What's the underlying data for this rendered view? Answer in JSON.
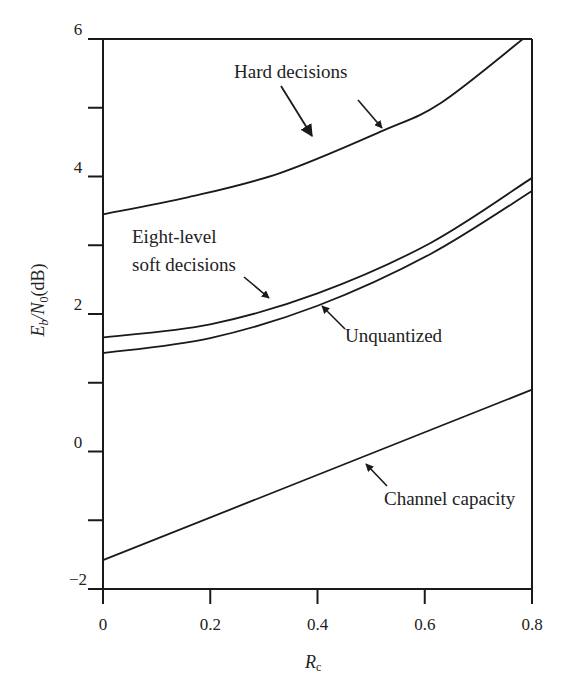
{
  "chart_data": {
    "type": "line",
    "title": "",
    "xlabel": "R_c",
    "ylabel": "E_b/N_0 (dB)",
    "xlim": [
      0,
      0.8
    ],
    "ylim": [
      -2,
      6
    ],
    "grid": false,
    "legend": "none (curves labeled by annotations with arrows)",
    "x_ticks": [
      0,
      0.2,
      0.4,
      0.6,
      0.8
    ],
    "x_tick_labels": [
      "0",
      "0.2",
      "0.4",
      "0.6",
      "0.8"
    ],
    "y_ticks": [
      -2,
      -1,
      0,
      1,
      2,
      3,
      4,
      5,
      6
    ],
    "y_tick_labels": [
      "−2",
      "",
      "0",
      "",
      "2",
      "",
      "4",
      "",
      "6"
    ],
    "series": [
      {
        "name": "Hard decisions",
        "x": [
          0,
          0.16,
          0.33,
          0.52,
          0.63,
          0.783
        ],
        "y": [
          3.45,
          3.7,
          4.05,
          4.66,
          5.07,
          6.0
        ]
      },
      {
        "name": "Eight-level soft decisions",
        "x": [
          0,
          0.2,
          0.4,
          0.61,
          0.8
        ],
        "y": [
          1.66,
          1.85,
          2.3,
          3.03,
          3.98
        ]
      },
      {
        "name": "Unquantized",
        "x": [
          0,
          0.2,
          0.4,
          0.61,
          0.8
        ],
        "y": [
          1.43,
          1.65,
          2.12,
          2.87,
          3.79
        ]
      },
      {
        "name": "Channel capacity",
        "x": [
          0,
          0.8
        ],
        "y": [
          -1.58,
          0.9
        ]
      }
    ],
    "annotations": [
      {
        "text": "Hard decisions",
        "target_series": "Hard decisions"
      },
      {
        "text": "Eight-level",
        "text2": "soft decisions",
        "target_series": "Eight-level soft decisions"
      },
      {
        "text": "Unquantized",
        "target_series": "Unquantized"
      },
      {
        "text": "Channel capacity",
        "target_series": "Channel capacity"
      }
    ]
  },
  "labels": {
    "ylabel_main": "E",
    "ylabel_sub_b": "b",
    "ylabel_slash_n": "/N",
    "ylabel_sub_0": "0",
    "ylabel_unit": "(dB)",
    "xlabel_main": "R",
    "xlabel_sub": "c",
    "hard": "Hard decisions",
    "eight_line1": "Eight-level",
    "eight_line2": "soft decisions",
    "unquantized": "Unquantized",
    "capacity": "Channel capacity"
  }
}
